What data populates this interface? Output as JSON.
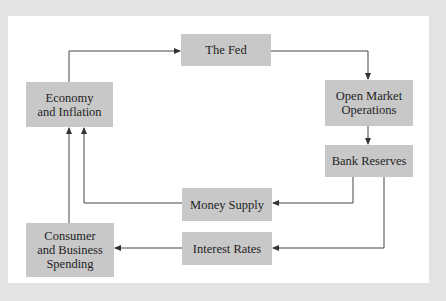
{
  "diagram": {
    "type": "flowchart",
    "colors": {
      "background": "#e3e3e3",
      "panel": "#ffffff",
      "node_fill": "#c8c8c8",
      "arrow": "#333333",
      "text": "#1f1f1f"
    },
    "nodes": {
      "fed": {
        "lines": [
          "The Fed"
        ]
      },
      "economy": {
        "lines": [
          "Economy",
          "and Inflation"
        ]
      },
      "omo": {
        "lines": [
          "Open Market",
          "Operations"
        ]
      },
      "reserves": {
        "lines": [
          "Bank Reserves"
        ]
      },
      "money": {
        "lines": [
          "Money Supply"
        ]
      },
      "rates": {
        "lines": [
          "Interest Rates"
        ]
      },
      "spending": {
        "lines": [
          "Consumer",
          "and Business",
          "Spending"
        ]
      }
    },
    "edges": [
      {
        "from": "Economy and Inflation",
        "to": "The Fed"
      },
      {
        "from": "The Fed",
        "to": "Open Market Operations"
      },
      {
        "from": "Open Market Operations",
        "to": "Bank Reserves"
      },
      {
        "from": "Bank Reserves",
        "to": "Money Supply"
      },
      {
        "from": "Bank Reserves",
        "to": "Interest Rates"
      },
      {
        "from": "Money Supply",
        "to": "Economy and Inflation"
      },
      {
        "from": "Interest Rates",
        "to": "Consumer and Business Spending"
      },
      {
        "from": "Consumer and Business Spending",
        "to": "Economy and Inflation"
      }
    ]
  }
}
